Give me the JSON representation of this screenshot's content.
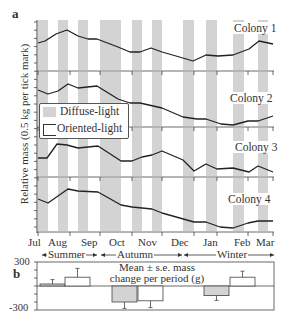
{
  "panel_a": {
    "letter": "a",
    "ylabel": "Relative mass (0.5 kg per tick mark)",
    "legend": {
      "diffuse": "Diffuse-light",
      "oriented": "Oriented-light"
    },
    "months": [
      "Jul",
      "Aug",
      "Sep",
      "Oct",
      "Nov",
      "Dec",
      "Jan",
      "Feb",
      "Mar"
    ],
    "seasons": [
      "Summer",
      "Autumn",
      "Winter"
    ]
  },
  "panel_b": {
    "letter": "b",
    "title_line1": "Mean ± s.e. mass",
    "title_line2": "change per period (g)",
    "ytick_top": "300",
    "ytick_bottom": "-300"
  },
  "colors": {
    "diffuse_fill": "#d3d3d3",
    "line": "#222222",
    "axis": "#444444"
  },
  "chart_data": [
    {
      "type": "line",
      "title": "Relative mass of colonies over time (a)",
      "xlabel": "",
      "ylabel": "Relative mass (0.5 kg per tick mark)",
      "x": [
        "Jul",
        "Aug",
        "Sep",
        "Oct",
        "Nov",
        "Dec",
        "Jan",
        "Feb",
        "Mar"
      ],
      "shaded_periods_label": "Diffuse-light",
      "unshaded_periods_label": "Oriented-light",
      "shaded_periods_x_px": [
        [
          38,
          48
        ],
        [
          58,
          68
        ],
        [
          78,
          88
        ],
        [
          100,
          121
        ],
        [
          132,
          142
        ],
        [
          152,
          162
        ],
        [
          183,
          194
        ],
        [
          206,
          217
        ],
        [
          233,
          244
        ],
        [
          258,
          268
        ]
      ],
      "series": [
        {
          "name": "Colony 1",
          "points_px": [
            [
              38,
              43
            ],
            [
              45,
              41
            ],
            [
              56,
              34
            ],
            [
              67,
              30
            ],
            [
              78,
              36
            ],
            [
              88,
              39
            ],
            [
              97,
              39
            ],
            [
              118,
              47
            ],
            [
              130,
              52
            ],
            [
              140,
              52
            ],
            [
              151,
              48
            ],
            [
              162,
              52
            ],
            [
              176,
              56
            ],
            [
              193,
              61
            ],
            [
              206,
              55
            ],
            [
              218,
              56
            ],
            [
              233,
              55
            ],
            [
              249,
              49
            ],
            [
              259,
              41
            ],
            [
              273,
              44
            ]
          ]
        },
        {
          "name": "Colony 2",
          "points_px": [
            [
              38,
              90
            ],
            [
              48,
              94
            ],
            [
              58,
              91
            ],
            [
              68,
              84
            ],
            [
              78,
              88
            ],
            [
              97,
              86
            ],
            [
              118,
              99
            ],
            [
              130,
              103
            ],
            [
              140,
              103
            ],
            [
              162,
              108
            ],
            [
              183,
              117
            ],
            [
              197,
              119
            ],
            [
              206,
              119
            ],
            [
              221,
              124
            ],
            [
              233,
              125
            ],
            [
              248,
              121
            ],
            [
              258,
              121
            ],
            [
              273,
              116
            ]
          ]
        },
        {
          "name": "Colony 3",
          "points_px": [
            [
              38,
              158
            ],
            [
              47,
              158
            ],
            [
              57,
              144
            ],
            [
              67,
              145
            ],
            [
              78,
              148
            ],
            [
              98,
              146
            ],
            [
              121,
              161
            ],
            [
              132,
              161
            ],
            [
              142,
              157
            ],
            [
              152,
              155
            ],
            [
              162,
              151
            ],
            [
              183,
              160
            ],
            [
              194,
              171
            ],
            [
              206,
              164
            ],
            [
              217,
              169
            ],
            [
              233,
              168
            ],
            [
              249,
              172
            ],
            [
              258,
              166
            ],
            [
              273,
              172
            ]
          ]
        },
        {
          "name": "Colony 4",
          "points_px": [
            [
              38,
              199
            ],
            [
              48,
              203
            ],
            [
              68,
              189
            ],
            [
              78,
              191
            ],
            [
              98,
              192
            ],
            [
              121,
              205
            ],
            [
              132,
              207
            ],
            [
              152,
              209
            ],
            [
              162,
              213
            ],
            [
              194,
              222
            ],
            [
              206,
              222
            ],
            [
              220,
              227
            ],
            [
              233,
              228
            ],
            [
              248,
              223
            ],
            [
              258,
              221
            ],
            [
              273,
              221
            ]
          ]
        }
      ],
      "colony_labels": [
        "Colony 1",
        "Colony 2",
        "Colony 3",
        "Colony 4"
      ]
    },
    {
      "type": "bar",
      "title": "Mean ± s.e. mass change per period (g)",
      "xlabel": "",
      "ylabel": "",
      "ylim": [
        -300,
        300
      ],
      "categories": [
        "Summer",
        "Autumn",
        "Winter"
      ],
      "series": [
        {
          "name": "Diffuse-light",
          "values": [
            25,
            -200,
            -120
          ],
          "errors": [
            55,
            80,
            60
          ]
        },
        {
          "name": "Oriented-light",
          "values": [
            110,
            -185,
            110
          ],
          "errors": [
            110,
            85,
            75
          ]
        }
      ]
    }
  ]
}
